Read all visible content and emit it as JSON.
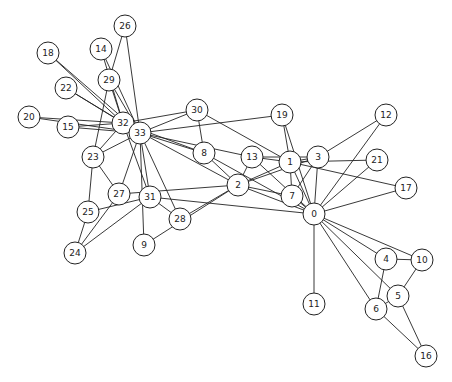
{
  "diagram": {
    "type": "network-graph",
    "node_radius": 11,
    "colors": {
      "background": "#ffffff",
      "stroke": "#222222",
      "node_fill": "#ffffff",
      "label": "#222222"
    },
    "nodes": [
      {
        "id": "0",
        "x": 314,
        "y": 214
      },
      {
        "id": "1",
        "x": 290,
        "y": 162
      },
      {
        "id": "2",
        "x": 238,
        "y": 185
      },
      {
        "id": "3",
        "x": 318,
        "y": 157
      },
      {
        "id": "4",
        "x": 386,
        "y": 259
      },
      {
        "id": "5",
        "x": 398,
        "y": 296
      },
      {
        "id": "6",
        "x": 376,
        "y": 309
      },
      {
        "id": "7",
        "x": 292,
        "y": 196
      },
      {
        "id": "8",
        "x": 204,
        "y": 153
      },
      {
        "id": "9",
        "x": 144,
        "y": 245
      },
      {
        "id": "10",
        "x": 422,
        "y": 260
      },
      {
        "id": "11",
        "x": 314,
        "y": 304
      },
      {
        "id": "12",
        "x": 386,
        "y": 115
      },
      {
        "id": "13",
        "x": 252,
        "y": 157
      },
      {
        "id": "14",
        "x": 101,
        "y": 49
      },
      {
        "id": "15",
        "x": 68,
        "y": 127
      },
      {
        "id": "16",
        "x": 426,
        "y": 356
      },
      {
        "id": "17",
        "x": 406,
        "y": 188
      },
      {
        "id": "18",
        "x": 48,
        "y": 53
      },
      {
        "id": "19",
        "x": 282,
        "y": 115
      },
      {
        "id": "20",
        "x": 29,
        "y": 117
      },
      {
        "id": "21",
        "x": 377,
        "y": 160
      },
      {
        "id": "22",
        "x": 66,
        "y": 88
      },
      {
        "id": "23",
        "x": 93,
        "y": 157
      },
      {
        "id": "24",
        "x": 75,
        "y": 253
      },
      {
        "id": "25",
        "x": 88,
        "y": 212
      },
      {
        "id": "26",
        "x": 125,
        "y": 26
      },
      {
        "id": "27",
        "x": 119,
        "y": 194
      },
      {
        "id": "28",
        "x": 180,
        "y": 219
      },
      {
        "id": "29",
        "x": 109,
        "y": 80
      },
      {
        "id": "30",
        "x": 197,
        "y": 110
      },
      {
        "id": "31",
        "x": 150,
        "y": 197
      },
      {
        "id": "32",
        "x": 123,
        "y": 123
      },
      {
        "id": "33",
        "x": 140,
        "y": 133
      }
    ],
    "edges": [
      [
        0,
        1
      ],
      [
        0,
        2
      ],
      [
        0,
        3
      ],
      [
        0,
        4
      ],
      [
        0,
        5
      ],
      [
        0,
        6
      ],
      [
        0,
        7
      ],
      [
        0,
        8
      ],
      [
        0,
        10
      ],
      [
        0,
        11
      ],
      [
        0,
        12
      ],
      [
        0,
        13
      ],
      [
        0,
        17
      ],
      [
        0,
        19
      ],
      [
        0,
        21
      ],
      [
        0,
        31
      ],
      [
        1,
        2
      ],
      [
        1,
        3
      ],
      [
        1,
        7
      ],
      [
        1,
        13
      ],
      [
        1,
        17
      ],
      [
        1,
        19
      ],
      [
        1,
        21
      ],
      [
        1,
        30
      ],
      [
        2,
        3
      ],
      [
        2,
        7
      ],
      [
        2,
        8
      ],
      [
        2,
        9
      ],
      [
        2,
        13
      ],
      [
        2,
        27
      ],
      [
        2,
        28
      ],
      [
        2,
        32
      ],
      [
        3,
        7
      ],
      [
        3,
        12
      ],
      [
        3,
        13
      ],
      [
        4,
        6
      ],
      [
        4,
        10
      ],
      [
        5,
        6
      ],
      [
        5,
        10
      ],
      [
        5,
        16
      ],
      [
        6,
        16
      ],
      [
        8,
        30
      ],
      [
        8,
        32
      ],
      [
        8,
        33
      ],
      [
        9,
        33
      ],
      [
        13,
        33
      ],
      [
        14,
        32
      ],
      [
        14,
        33
      ],
      [
        15,
        32
      ],
      [
        15,
        33
      ],
      [
        18,
        32
      ],
      [
        18,
        33
      ],
      [
        19,
        33
      ],
      [
        20,
        32
      ],
      [
        20,
        33
      ],
      [
        22,
        32
      ],
      [
        22,
        33
      ],
      [
        23,
        25
      ],
      [
        23,
        27
      ],
      [
        23,
        29
      ],
      [
        23,
        32
      ],
      [
        23,
        33
      ],
      [
        24,
        25
      ],
      [
        24,
        27
      ],
      [
        24,
        31
      ],
      [
        25,
        31
      ],
      [
        26,
        29
      ],
      [
        26,
        33
      ],
      [
        27,
        33
      ],
      [
        28,
        31
      ],
      [
        28,
        33
      ],
      [
        29,
        32
      ],
      [
        29,
        33
      ],
      [
        30,
        32
      ],
      [
        30,
        33
      ],
      [
        31,
        32
      ],
      [
        31,
        33
      ],
      [
        32,
        33
      ]
    ]
  }
}
